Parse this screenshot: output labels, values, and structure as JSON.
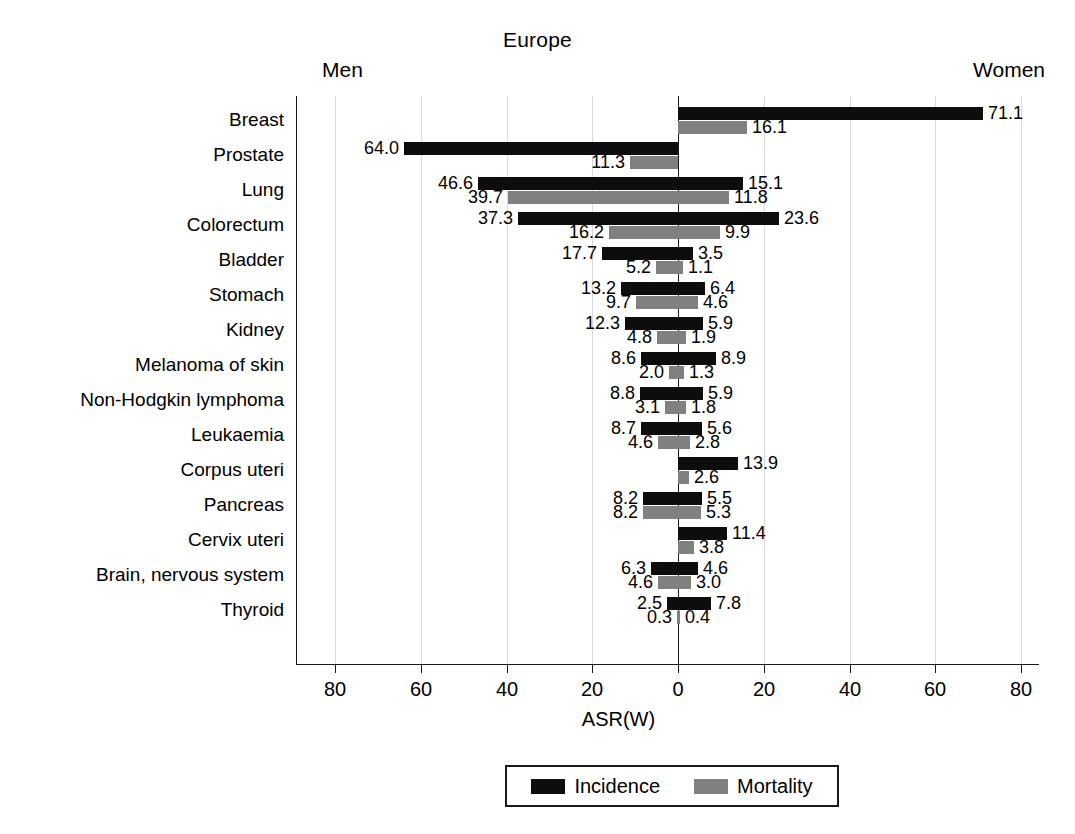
{
  "chart_data": {
    "type": "bar",
    "subtype": "diverging-horizontal-population-pyramid",
    "title": "Europe",
    "left_header": "Men",
    "right_header": "Women",
    "xlabel": "ASR(W)",
    "ylabel": "",
    "xlim": [
      -80,
      80
    ],
    "xticks": [
      -80,
      -60,
      -40,
      -20,
      0,
      20,
      40,
      60,
      80
    ],
    "xticklabels": [
      "80",
      "60",
      "40",
      "20",
      "0",
      "20",
      "40",
      "60",
      "80"
    ],
    "grid": true,
    "legend_position": "bottom",
    "legend": [
      {
        "name": "Incidence",
        "color": "#0d0d0d"
      },
      {
        "name": "Mortality",
        "color": "#808080"
      }
    ],
    "categories": [
      "Breast",
      "Prostate",
      "Lung",
      "Colorectum",
      "Bladder",
      "Stomach",
      "Kidney",
      "Melanoma of skin",
      "Non-Hodgkin lymphoma",
      "Leukaemia",
      "Corpus uteri",
      "Pancreas",
      "Cervix uteri",
      "Brain, nervous system",
      "Thyroid"
    ],
    "series": [
      {
        "name": "Men Incidence",
        "side": "left",
        "color": "#0d0d0d",
        "values": [
          null,
          64.0,
          46.6,
          37.3,
          17.7,
          13.2,
          12.3,
          8.6,
          8.8,
          8.7,
          null,
          8.2,
          null,
          6.3,
          2.5
        ],
        "labels": [
          "",
          "64.0",
          "46.6",
          "37.3",
          "17.7",
          "13.2",
          "12.3",
          "8.6",
          "8.8",
          "8.7",
          "",
          "8.2",
          "",
          "6.3",
          "2.5"
        ]
      },
      {
        "name": "Men Mortality",
        "side": "left",
        "color": "#808080",
        "values": [
          null,
          11.3,
          39.7,
          16.2,
          5.2,
          9.7,
          4.8,
          2.0,
          3.1,
          4.6,
          null,
          8.2,
          null,
          4.6,
          0.3
        ],
        "labels": [
          "",
          "11.3",
          "39.7",
          "16.2",
          "5.2",
          "9.7",
          "4.8",
          "2.0",
          "3.1",
          "4.6",
          "",
          "8.2",
          "",
          "4.6",
          "0.3"
        ]
      },
      {
        "name": "Women Incidence",
        "side": "right",
        "color": "#0d0d0d",
        "values": [
          71.1,
          null,
          15.1,
          23.6,
          3.5,
          6.4,
          5.9,
          8.9,
          5.9,
          5.6,
          13.9,
          5.5,
          11.4,
          4.6,
          7.8
        ],
        "labels": [
          "71.1",
          "",
          "15.1",
          "23.6",
          "3.5",
          "6.4",
          "5.9",
          "8.9",
          "5.9",
          "5.6",
          "13.9",
          "5.5",
          "11.4",
          "4.6",
          "7.8"
        ]
      },
      {
        "name": "Women Mortality",
        "side": "right",
        "color": "#808080",
        "values": [
          16.1,
          null,
          11.8,
          9.9,
          1.1,
          4.6,
          1.9,
          1.3,
          1.8,
          2.8,
          2.6,
          5.3,
          3.8,
          3.0,
          0.4
        ],
        "labels": [
          "16.1",
          "",
          "11.8",
          "9.9",
          "1.1",
          "4.6",
          "1.9",
          "1.3",
          "1.8",
          "2.8",
          "2.6",
          "5.3",
          "3.8",
          "3.0",
          "0.4"
        ]
      }
    ]
  }
}
